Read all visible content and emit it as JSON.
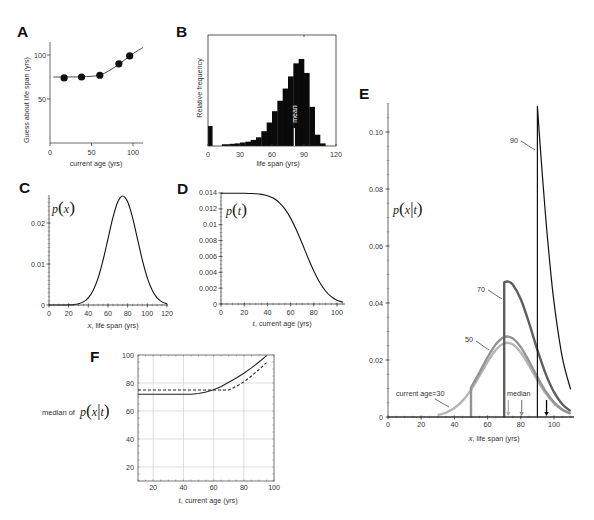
{
  "chart_data": [
    {
      "panel": "A",
      "type": "scatter",
      "title": "",
      "xlabel": "current age (yrs)",
      "ylabel": "Guess about life span (yrs)",
      "xlim": [
        0,
        111
      ],
      "ylim": [
        0,
        115
      ],
      "xticks": [
        0,
        50,
        100
      ],
      "xtick_labels": [
        "0",
        "50",
        "100"
      ],
      "yticks": [
        50,
        100
      ],
      "ytick_labels": [
        "50",
        "100"
      ],
      "grid": false,
      "series": [
        {
          "name": "human judgments",
          "kind": "points",
          "color": "#111111",
          "points": [
            [
              17,
              74
            ],
            [
              38,
              75
            ],
            [
              60,
              77
            ],
            [
              83,
              90
            ],
            [
              96,
              99
            ]
          ]
        },
        {
          "name": "model prediction",
          "kind": "curve",
          "color": "#333333",
          "points": [
            [
              4,
              75
            ],
            [
              20,
              75
            ],
            [
              40,
              75.3
            ],
            [
              55,
              76.2
            ],
            [
              62,
              77.8
            ],
            [
              70,
              81.5
            ],
            [
              80,
              87.5
            ],
            [
              90,
              94.5
            ],
            [
              100,
              101.5
            ],
            [
              112,
              108.5
            ]
          ]
        }
      ]
    },
    {
      "panel": "B",
      "type": "bar",
      "title": "",
      "xlabel": "life span (yrs)",
      "ylabel": "Relative frequency",
      "xlim": [
        0,
        120
      ],
      "ylim": [
        0,
        1.28
      ],
      "xticks": [
        0,
        30,
        60,
        90,
        120
      ],
      "xtick_labels": [
        "0",
        "30",
        "60",
        "90",
        "120"
      ],
      "bar_color": "#0a0a0a",
      "bins": [
        [
          0,
          4,
          0.23
        ],
        [
          13,
          20,
          0.02
        ],
        [
          20,
          25,
          0.025
        ],
        [
          25,
          30,
          0.03
        ],
        [
          30,
          35,
          0.04
        ],
        [
          35,
          40,
          0.05
        ],
        [
          40,
          45,
          0.07
        ],
        [
          45,
          50,
          0.1
        ],
        [
          50,
          55,
          0.17
        ],
        [
          55,
          60,
          0.27
        ],
        [
          60,
          65,
          0.4
        ],
        [
          65,
          70,
          0.52
        ],
        [
          70,
          75,
          0.66
        ],
        [
          75,
          80,
          0.8
        ],
        [
          80,
          85,
          0.95
        ],
        [
          85,
          90,
          1.0
        ],
        [
          90,
          95,
          0.84
        ],
        [
          95,
          100,
          0.45
        ],
        [
          100,
          105,
          0.13
        ],
        [
          105,
          110,
          0.03
        ]
      ],
      "annotations": [
        {
          "text": "mean",
          "x": 81
        }
      ]
    },
    {
      "panel": "C",
      "type": "line",
      "title": "",
      "ylabel_math": "p(x)",
      "xlabel_var": "x",
      "xlabel_text": ", life span (yrs)",
      "xlim": [
        0,
        121
      ],
      "ylim": [
        0,
        0.0268
      ],
      "xticks": [
        0,
        20,
        40,
        60,
        80,
        100,
        120
      ],
      "xtick_labels": [
        "0",
        "20",
        "40",
        "60",
        "80",
        "100",
        "120"
      ],
      "yticks": [
        0,
        0.01,
        0.02
      ],
      "ytick_labels": [
        "0",
        "0.01",
        "0.02"
      ],
      "grid": false,
      "series": [
        {
          "name": "p(x)",
          "color": "#111111",
          "points": [
            [
              0,
              0
            ],
            [
              10,
              2e-06
            ],
            [
              15,
              9e-06
            ],
            [
              20,
              3.2e-05
            ],
            [
              25,
              0.000103
            ],
            [
              30,
              0.000295
            ],
            [
              35,
              0.00076
            ],
            [
              40,
              0.00175
            ],
            [
              45,
              0.0036
            ],
            [
              50,
              0.00663
            ],
            [
              55,
              0.01094
            ],
            [
              60,
              0.01613
            ],
            [
              65,
              0.0213
            ],
            [
              70,
              0.02516
            ],
            [
              75,
              0.0266
            ],
            [
              80,
              0.02516
            ],
            [
              85,
              0.0213
            ],
            [
              90,
              0.01613
            ],
            [
              95,
              0.01094
            ],
            [
              100,
              0.00663
            ],
            [
              105,
              0.0036
            ],
            [
              110,
              0.00175
            ],
            [
              115,
              0.00076
            ],
            [
              120,
              0.000295
            ]
          ]
        }
      ]
    },
    {
      "panel": "D",
      "type": "line",
      "title": "",
      "ylabel_math": "p(t)",
      "xlabel_var": "t",
      "xlabel_text": ", current age (yrs)",
      "xlim": [
        0,
        107
      ],
      "ylim": [
        0,
        0.014
      ],
      "xticks": [
        0,
        20,
        40,
        60,
        80,
        100
      ],
      "xtick_labels": [
        "0",
        "20",
        "40",
        "60",
        "80",
        "100"
      ],
      "yticks": [
        0,
        0.002,
        0.004,
        0.006,
        0.008,
        0.01,
        0.012,
        0.014
      ],
      "ytick_labels": [
        "0",
        "0.002",
        "0.004",
        "0.006",
        "0.008",
        "0.01",
        "0.012",
        "0.014"
      ],
      "grid": false,
      "series": [
        {
          "name": "p(t)",
          "color": "#111111",
          "points": [
            [
              0,
              0.01396
            ],
            [
              10,
              0.01396
            ],
            [
              20,
              0.01396
            ],
            [
              25,
              0.01394
            ],
            [
              30,
              0.01391
            ],
            [
              35,
              0.01383
            ],
            [
              40,
              0.01366
            ],
            [
              45,
              0.01336
            ],
            [
              50,
              0.01282
            ],
            [
              55,
              0.01199
            ],
            [
              60,
              0.01083
            ],
            [
              65,
              0.00933
            ],
            [
              70,
              0.00762
            ],
            [
              75,
              0.00583
            ],
            [
              80,
              0.00416
            ],
            [
              85,
              0.00274
            ],
            [
              90,
              0.00167
            ],
            [
              95,
              0.00093
            ],
            [
              100,
              0.00048
            ],
            [
              105,
              0.00023
            ]
          ]
        }
      ]
    },
    {
      "panel": "E",
      "type": "line",
      "title": "",
      "ylabel_math": "p(x|t)",
      "xlabel_var": "x",
      "xlabel_text": ", life span (yrs)",
      "xlim": [
        0,
        112
      ],
      "ylim": [
        0,
        0.11
      ],
      "xticks": [
        0,
        20,
        40,
        60,
        80,
        100
      ],
      "xtick_labels": [
        "0",
        "20",
        "40",
        "60",
        "80",
        "100"
      ],
      "yticks": [
        0,
        0.02,
        0.04,
        0.06,
        0.08,
        0.1
      ],
      "ytick_labels": [
        "0",
        "0.02",
        "0.04",
        "0.06",
        "0.08",
        "0.10"
      ],
      "grid": false,
      "series": [
        {
          "name": "t=30",
          "label": "current age=30",
          "color": "#b5b5b5",
          "points": [
            [
              30,
              0.0007
            ],
            [
              35,
              0.00156
            ],
            [
              40,
              0.00314
            ],
            [
              45,
              0.00575
            ],
            [
              50,
              0.00954
            ],
            [
              55,
              0.0143
            ],
            [
              60,
              0.01934
            ],
            [
              65,
              0.02356
            ],
            [
              70,
              0.02585
            ],
            [
              75,
              0.02551
            ],
            [
              80,
              0.02261
            ],
            [
              85,
              0.01802
            ],
            [
              90,
              0.01289
            ],
            [
              95,
              0.00828
            ],
            [
              100,
              0.00477
            ],
            [
              105,
              0.00247
            ],
            [
              110,
              0.00114
            ]
          ]
        },
        {
          "name": "t=50",
          "label": "50",
          "color": "#939393",
          "points": [
            [
              50,
              0
            ],
            [
              50,
              0.01035
            ],
            [
              55,
              0.0155
            ],
            [
              60,
              0.02097
            ],
            [
              65,
              0.02556
            ],
            [
              70,
              0.02804
            ],
            [
              75,
              0.02766
            ],
            [
              80,
              0.02453
            ],
            [
              85,
              0.01954
            ],
            [
              90,
              0.01397
            ],
            [
              95,
              0.00898
            ],
            [
              100,
              0.00517
            ],
            [
              105,
              0.00267
            ],
            [
              110,
              0.00124
            ]
          ]
        },
        {
          "name": "t=70",
          "label": "70",
          "color": "#5e5e5e",
          "points": [
            [
              70,
              0
            ],
            [
              70,
              0.04721
            ],
            [
              72,
              0.04755
            ],
            [
              75,
              0.04658
            ],
            [
              80,
              0.0413
            ],
            [
              85,
              0.03291
            ],
            [
              90,
              0.02353
            ],
            [
              95,
              0.01512
            ],
            [
              100,
              0.00871
            ],
            [
              105,
              0.0045
            ],
            [
              110,
              0.00209
            ]
          ]
        },
        {
          "name": "t=90",
          "label": "90",
          "color": "#111111",
          "points": [
            [
              90,
              0
            ],
            [
              90,
              0.109
            ],
            [
              92,
              0.0925
            ],
            [
              95,
              0.07
            ],
            [
              97,
              0.057
            ],
            [
              100,
              0.0403
            ],
            [
              105,
              0.0209
            ],
            [
              110,
              0.0097
            ]
          ]
        }
      ],
      "median_label": "median",
      "median_markers": [
        {
          "x": 72.5,
          "color": "#b0b0b0"
        },
        {
          "x": 80.5,
          "color": "#8a8a8a"
        },
        {
          "x": 95.5,
          "color": "#000000"
        }
      ]
    },
    {
      "panel": "F",
      "type": "line",
      "title": "",
      "ylabel_prefix": "median of",
      "ylabel_math": "p(x|t)",
      "xlabel_var": "t",
      "xlabel_text": ", current age (yrs)",
      "xlim": [
        10,
        100
      ],
      "ylim": [
        10,
        100
      ],
      "xticks": [
        20,
        40,
        60,
        80,
        100
      ],
      "xtick_labels": [
        "20",
        "40",
        "60",
        "80",
        "100"
      ],
      "yticks": [
        20,
        40,
        60,
        80,
        100
      ],
      "ytick_labels": [
        "20",
        "40",
        "60",
        "80",
        "100"
      ],
      "grid": true,
      "series": [
        {
          "name": "solid line",
          "style": "solid",
          "color": "#222222",
          "points": [
            [
              10,
              72
            ],
            [
              45,
              72
            ],
            [
              50,
              72.5
            ],
            [
              55,
              73.6
            ],
            [
              60,
              75.2
            ],
            [
              65,
              77.5
            ],
            [
              70,
              80.5
            ],
            [
              75,
              83.6
            ],
            [
              80,
              87
            ],
            [
              85,
              90.8
            ],
            [
              90,
              95
            ],
            [
              95,
              99.5
            ]
          ]
        },
        {
          "name": "dashed line",
          "style": "dashed",
          "color": "#222222",
          "points": [
            [
              10,
              75
            ],
            [
              70,
              75
            ],
            [
              75,
              77.6
            ],
            [
              80,
              80.8
            ],
            [
              85,
              85
            ],
            [
              90,
              89.6
            ],
            [
              95,
              94.6
            ]
          ]
        }
      ]
    }
  ]
}
